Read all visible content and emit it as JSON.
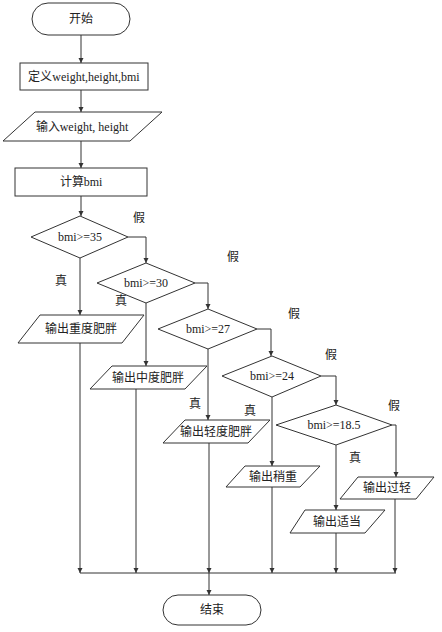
{
  "flowchart": {
    "start": "开始",
    "define": "定义weight,height,bmi",
    "input": "输入weight, height",
    "compute": "计算bmi",
    "conditions": [
      {
        "text": "bmi>=35",
        "true_label": "真",
        "false_label": "假",
        "output": "输出重度肥胖"
      },
      {
        "text": "bmi>=30",
        "true_label": "真",
        "false_label": "假",
        "output": "输出中度肥胖"
      },
      {
        "text": "bmi>=27",
        "true_label": "真",
        "false_label": "假",
        "output": "输出轻度肥胖"
      },
      {
        "text": "bmi>=24",
        "true_label": "真",
        "false_label": "假",
        "output": "输出稍重"
      },
      {
        "text": "bmi>=18.5",
        "true_label": "真",
        "false_label": "假",
        "output": "输出适当"
      }
    ],
    "else_output": "输出过轻",
    "end": "结束"
  }
}
